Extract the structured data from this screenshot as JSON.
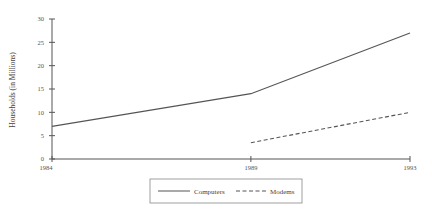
{
  "chart_data": {
    "type": "line",
    "title": "",
    "xlabel": "",
    "ylabel": "Households (in Millions)",
    "x": [
      1984,
      1989,
      1993
    ],
    "x_tick_labels": [
      "1984",
      "1989",
      "1993"
    ],
    "y_ticks": [
      0,
      5,
      10,
      15,
      20,
      25,
      30
    ],
    "y_tick_labels": [
      "0",
      "5",
      "10",
      "15",
      "20",
      "25",
      "30"
    ],
    "ylim": [
      0,
      30
    ],
    "xlim": [
      1984,
      1993
    ],
    "grid": false,
    "legend_position": "bottom-center",
    "series": [
      {
        "name": "Computers",
        "style": "solid",
        "color": "#555555",
        "x": [
          1984,
          1989,
          1993
        ],
        "values": [
          7,
          14,
          27
        ]
      },
      {
        "name": "Modems",
        "style": "dashed",
        "color": "#555555",
        "x": [
          1989,
          1993
        ],
        "values": [
          3.5,
          10
        ]
      }
    ]
  },
  "legend": {
    "items": [
      {
        "label": "Computers",
        "style": "solid"
      },
      {
        "label": "Modems",
        "style": "dashed"
      }
    ]
  },
  "axis": {
    "ylabel": "Households (in Millions)"
  }
}
